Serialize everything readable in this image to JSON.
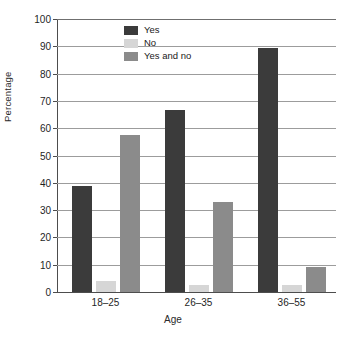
{
  "chart_data": {
    "type": "bar",
    "title": "",
    "subtitle": "",
    "xlabel": "Age",
    "ylabel": "Percentage",
    "categories": [
      "18–25",
      "26–35",
      "36–55"
    ],
    "series": [
      {
        "name": "Yes",
        "color": "#3b3b3b",
        "values": [
          39,
          66.5,
          89.5
        ]
      },
      {
        "name": "No",
        "color": "#d6d6d6",
        "values": [
          4,
          2.5,
          2.5
        ]
      },
      {
        "name": "Yes and no",
        "color": "#8b8b8b",
        "values": [
          57.5,
          33,
          9
        ]
      }
    ],
    "ylim": [
      0,
      100
    ],
    "ytick_step": 10,
    "yticks": [
      "0",
      "10",
      "20",
      "30",
      "40",
      "50",
      "60",
      "70",
      "80",
      "90",
      "100"
    ],
    "grid": true,
    "grid_axis": "y",
    "legend_position": "top-center-inside",
    "axis_color": "#4d4d4d",
    "grid_color": "#9c9c9c",
    "background": "#ffffff"
  },
  "legend": {
    "entries": [
      {
        "label": "Yes",
        "color": "#3b3b3b"
      },
      {
        "label": "No",
        "color": "#d6d6d6"
      },
      {
        "label": "Yes and no",
        "color": "#8b8b8b"
      }
    ]
  }
}
